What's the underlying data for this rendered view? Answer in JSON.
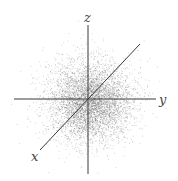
{
  "diagram": {
    "type": "3d-gaussian-point-cloud",
    "axes": {
      "x": {
        "label": "x",
        "from": [
          88,
          99
        ],
        "to": [
          40,
          150
        ],
        "label_pos": [
          33,
          160
        ]
      },
      "y": {
        "label": "y",
        "from": [
          14,
          99
        ],
        "to": [
          156,
          99
        ],
        "label_pos": [
          159,
          104
        ]
      },
      "z": {
        "label": "z",
        "from": [
          88,
          25
        ],
        "to": [
          88,
          174
        ],
        "label_pos": [
          84,
          21
        ]
      },
      "diagonal": {
        "from": [
          40,
          150
        ],
        "to": [
          140,
          44
        ]
      }
    },
    "cloud": {
      "center": [
        90,
        101
      ],
      "sigma": 20,
      "points": 5000,
      "color": "#555555"
    },
    "colors": {
      "axis": "#3a3a3a",
      "label": "#444444",
      "background": "#ffffff"
    }
  }
}
